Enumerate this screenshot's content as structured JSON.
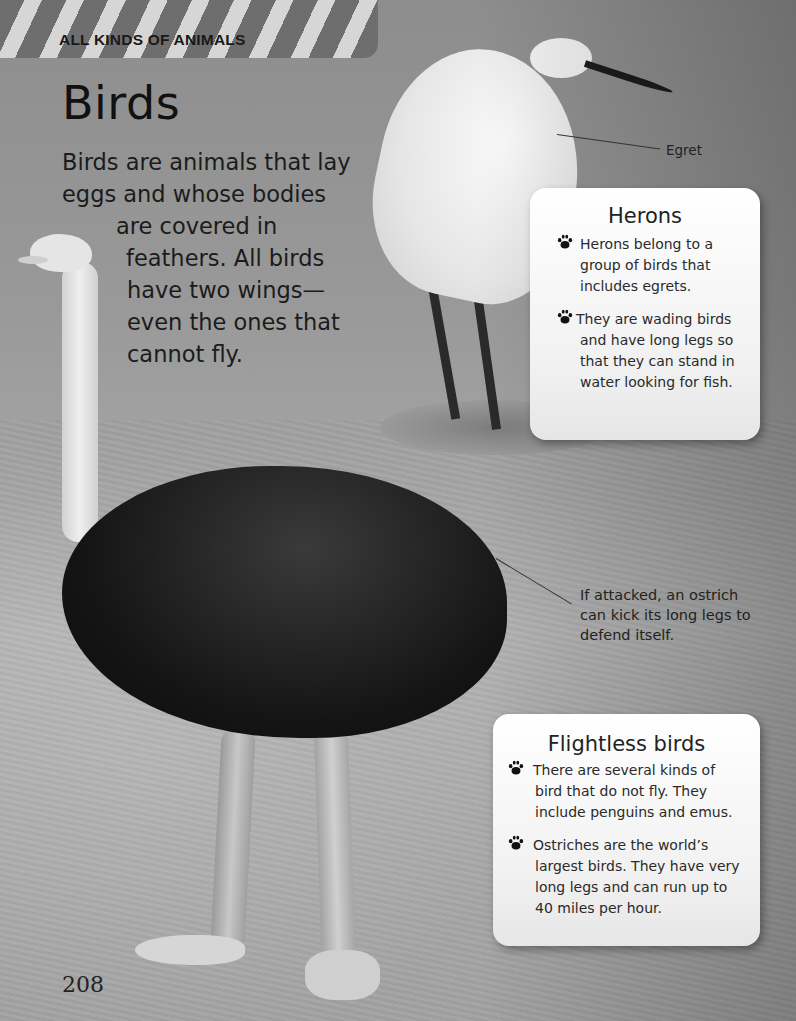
{
  "header": {
    "section_label": "ALL KINDS OF ANIMALS"
  },
  "title": "Birds",
  "intro": {
    "lines": [
      "Birds are animals that lay",
      "eggs and whose bodies",
      "are covered in",
      "feathers. All birds",
      "have two wings—",
      "even the ones that",
      "cannot fly."
    ]
  },
  "captions": {
    "egret": "Egret",
    "ostrich": [
      "If attacked, an ostrich",
      "can kick its long legs to",
      "defend itself."
    ]
  },
  "herons_box": {
    "title": "Herons",
    "bullets": [
      {
        "icon": "paw-print-icon",
        "lines": [
          "Herons belong to a",
          "group of birds that",
          "includes egrets."
        ]
      },
      {
        "icon": "paw-print-icon",
        "lines": [
          "They are wading birds",
          "and have long legs so",
          "that they can stand in",
          "water looking for fish."
        ]
      }
    ]
  },
  "flightless_box": {
    "title": "Flightless birds",
    "bullets": [
      {
        "icon": "paw-print-icon",
        "lines": [
          "There are several kinds of",
          "bird that do not fly. They",
          "include penguins and emus."
        ]
      },
      {
        "icon": "paw-print-icon",
        "lines": [
          "Ostriches are the world’s",
          "largest birds. They have very",
          "long legs and can run up to",
          "40 miles per hour."
        ]
      }
    ]
  },
  "page_number": "208",
  "colors": {
    "text": "#1e1e1e",
    "box_bg": "#f5f5f5",
    "header_stripe_dark": "#6e6e6e",
    "header_stripe_light": "#d6d6d6"
  }
}
